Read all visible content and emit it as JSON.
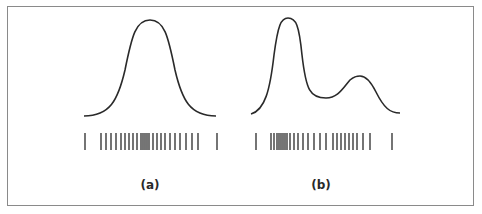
{
  "figure": {
    "panels": [
      {
        "label": "(a)",
        "label_x": 150,
        "description": "Unimodal density curve with sample tick marks (rug plot)",
        "curve": {
          "type": "unimodal",
          "x_start": 84,
          "x_end": 216,
          "baseline_y": 116,
          "peaks": [
            {
              "x": 145,
              "y": 20
            }
          ]
        },
        "ticks_x": [
          85,
          101,
          106,
          111,
          116,
          121,
          125,
          129,
          133,
          137,
          141,
          143,
          145,
          147,
          149,
          153,
          157,
          161,
          165,
          170,
          175,
          180,
          186,
          192,
          198,
          217
        ]
      },
      {
        "label": "(b)",
        "label_x": 321,
        "description": "Bimodal density curve with sample tick marks (rug plot)",
        "curve": {
          "type": "bimodal",
          "x_start": 251,
          "x_end": 400,
          "baseline_y": 114,
          "peaks": [
            {
              "x": 288,
              "y": 18
            },
            {
              "x": 360,
              "y": 76
            }
          ],
          "valley": {
            "x": 326,
            "y": 98
          }
        },
        "ticks_x": [
          256,
          271,
          274,
          277,
          279,
          281,
          283,
          285,
          287,
          290,
          294,
          298,
          303,
          308,
          314,
          320,
          326,
          333,
          337,
          341,
          345,
          349,
          353,
          357,
          363,
          370,
          392
        ]
      }
    ],
    "tick_y_top": 133,
    "tick_y_bottom": 150,
    "colors": {
      "stroke": "#2a2a2a",
      "border": "#8a8a8a",
      "background": "#ffffff"
    }
  }
}
